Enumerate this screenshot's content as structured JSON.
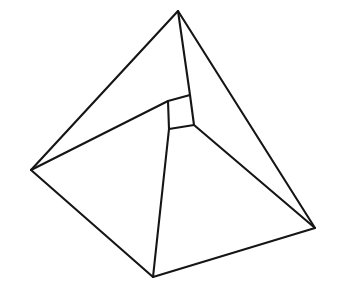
{
  "figure": {
    "shape_name": "square-frustum",
    "canvas": {
      "width": 338,
      "height": 288,
      "background_color": "#ffffff"
    },
    "style": {
      "stroke_color": "#151515",
      "stroke_width": 2.1,
      "fill": "none"
    },
    "vertices": {
      "base": {
        "left": {
          "label": "A",
          "x": 31,
          "y": 170
        },
        "top": {
          "label": "B",
          "x": 178,
          "y": 11
        },
        "right": {
          "label": "C",
          "x": 315,
          "y": 228
        },
        "bottom": {
          "label": "D",
          "x": 153,
          "y": 277
        }
      },
      "top_face": {
        "left": {
          "label": "E",
          "x": 168,
          "y": 101
        },
        "top": {
          "label": "F",
          "x": 190,
          "y": 95
        },
        "right": {
          "label": "G",
          "x": 194,
          "y": 125
        },
        "bottom": {
          "label": "H",
          "x": 169,
          "y": 129
        }
      }
    },
    "edges": {
      "base_outline": "M 31 170 L 178 11 L 315 228 L 153 277 Z",
      "top_outline": "M 168 101 L 190 95 L 194 125 L 169 129 Z",
      "lateral_left": "M 31 170 L 168 101",
      "lateral_top": "M 178 11 L 190 95",
      "lateral_right": "M 315 228 L 194 125",
      "lateral_bottom": "M 153 277 L 169 129"
    }
  }
}
